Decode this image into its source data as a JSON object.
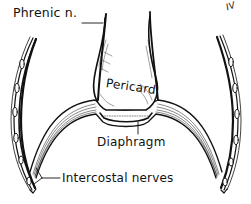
{
  "figure": {
    "type": "anatomical line drawing",
    "labels": {
      "phrenic": "Phrenic n.",
      "pericard": "Pericard.",
      "diaphragm": "Diaphragm",
      "intercostal": "Intercostal nerves",
      "rib_mark": "IV"
    },
    "caption": "",
    "colors": {
      "ink": "#111111",
      "background": "#ffffff"
    }
  }
}
